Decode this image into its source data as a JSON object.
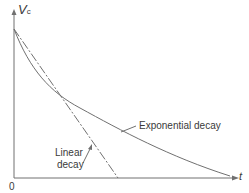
{
  "diagram": {
    "y_axis_label": "V",
    "y_axis_subscript": "c",
    "x_axis_label": "t",
    "origin_label": "0",
    "curves": [
      {
        "name": "Exponential decay",
        "style": "solid"
      },
      {
        "name": "Linear decay",
        "style": "dash-dot"
      }
    ],
    "labels": {
      "exponential": "Exponential decay",
      "linear_line1": "Linear",
      "linear_line2": "decay"
    },
    "colors": {
      "line": "#707070",
      "text": "#3a3a3a"
    }
  }
}
